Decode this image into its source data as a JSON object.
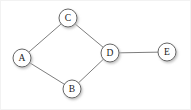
{
  "figure": {
    "width": 191,
    "height": 110,
    "background_color": "#ffffff",
    "border_color": "#f2f2f2"
  },
  "style": {
    "node_fill": "#ffffff",
    "node_stroke": "#555555",
    "node_radius": 9,
    "edge_color": "#6e6e6e",
    "edge_width": 0.9,
    "label_color": "#1a1a1a",
    "shadow_color": "#c9c9c9"
  },
  "graph": {
    "directed": false,
    "node_count": 5,
    "edge_count": 5,
    "nodes": [
      {
        "id": "A",
        "label": "A",
        "x": 22,
        "y": 58
      },
      {
        "id": "B",
        "label": "B",
        "x": 72,
        "y": 89
      },
      {
        "id": "C",
        "label": "C",
        "x": 68,
        "y": 18
      },
      {
        "id": "D",
        "label": "D",
        "x": 110,
        "y": 53
      },
      {
        "id": "E",
        "label": "E",
        "x": 167,
        "y": 52
      }
    ],
    "edges": [
      {
        "id": "A-C",
        "source": "A",
        "target": "C",
        "x1": 22,
        "y1": 58,
        "x2": 68,
        "y2": 18
      },
      {
        "id": "C-D",
        "source": "C",
        "target": "D",
        "x1": 68,
        "y1": 18,
        "x2": 110,
        "y2": 53
      },
      {
        "id": "A-B",
        "source": "A",
        "target": "B",
        "x1": 22,
        "y1": 58,
        "x2": 72,
        "y2": 89
      },
      {
        "id": "B-D",
        "source": "B",
        "target": "D",
        "x1": 72,
        "y1": 89,
        "x2": 110,
        "y2": 53
      },
      {
        "id": "D-E",
        "source": "D",
        "target": "E",
        "x1": 110,
        "y1": 53,
        "x2": 167,
        "y2": 52
      }
    ]
  }
}
